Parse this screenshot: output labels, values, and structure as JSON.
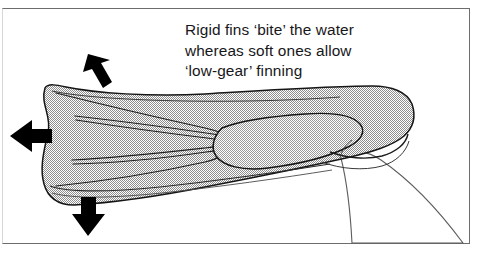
{
  "figure": {
    "kind": "instructional-diagram",
    "border_color": "#6d6d6d",
    "background_color": "#ffffff"
  },
  "caption": {
    "line1": "Rigid fins ‘bite’ the water",
    "line2": "whereas soft ones allow",
    "line3": "‘low-gear’ finning",
    "text_color": "#17171a"
  },
  "illustration": {
    "fin_fill_color": "#b4b4b4",
    "fin_outline_color": "#1a1a1a",
    "leg_outline_color": "#5a5a5a",
    "arrow_color": "#000000",
    "parts": [
      {
        "name": "fin-blade",
        "label": "fin blade"
      },
      {
        "name": "fin-ribs",
        "label": "stiffening ribs"
      },
      {
        "name": "foot-pocket",
        "label": "foot pocket"
      },
      {
        "name": "heel-strap",
        "label": "heel"
      },
      {
        "name": "diver-leg",
        "label": "leg"
      }
    ],
    "arrows": [
      {
        "name": "arrow-up-left",
        "direction": "up-left"
      },
      {
        "name": "arrow-left",
        "direction": "left"
      },
      {
        "name": "arrow-down",
        "direction": "down"
      }
    ]
  }
}
